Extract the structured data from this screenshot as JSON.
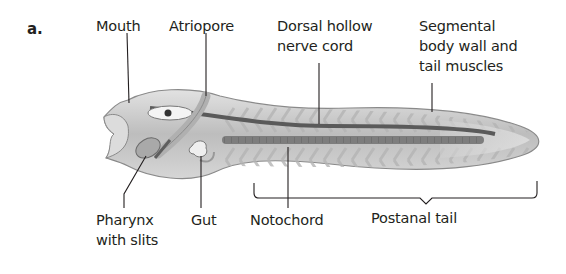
{
  "figure": {
    "panel_label": "a.",
    "labels": {
      "mouth": "Mouth",
      "atriopore": "Atriopore",
      "nerve_cord_line1": "Dorsal hollow",
      "nerve_cord_line2": "nerve cord",
      "muscles_line1": "Segmental",
      "muscles_line2": "body wall and",
      "muscles_line3": "tail muscles",
      "pharynx_line1": "Pharynx",
      "pharynx_line2": "with slits",
      "gut": "Gut",
      "notochord": "Notochord",
      "postanal_tail": "Postanal tail"
    }
  },
  "colors": {
    "text": "#231f20",
    "leader_line": "#231f20",
    "body_fill": "#c9c9c9",
    "body_outline": "#8a8a8a",
    "muscle_band": "#d8d8d8",
    "nerve_cord": "#5a5a5a",
    "notochord": "#7d7d7d"
  }
}
